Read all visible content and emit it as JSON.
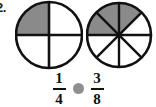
{
  "problem": {
    "number_label": "2.",
    "type": "fraction-comparison"
  },
  "colors": {
    "shaded": "#8a8a8a",
    "unshaded": "#ffffff",
    "outline": "#111111",
    "placeholder": "#8f8f8f"
  },
  "diagrams": [
    {
      "name": "left-circle",
      "total_parts": 4,
      "shaded_parts": 1,
      "shaded_sector_indices": [
        3
      ],
      "fraction_text": "1/4",
      "description": "circle divided into 4 equal quarters, top-left quarter shaded"
    },
    {
      "name": "right-circle",
      "total_parts": 8,
      "shaded_parts": 3,
      "shaded_sector_indices": [
        5,
        6,
        7
      ],
      "fraction_text": "3/8",
      "description": "circle divided into 8 equal eighths, three eighths shaded across the upper-left"
    }
  ],
  "comparison": {
    "left_fraction": {
      "numerator": "1",
      "denominator": "4"
    },
    "operator_symbol": "",
    "operator_state": "blank",
    "right_fraction": {
      "numerator": "3",
      "denominator": "8"
    }
  }
}
